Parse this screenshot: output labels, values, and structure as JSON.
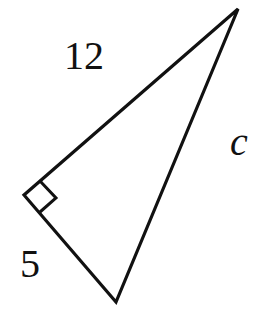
{
  "diagram": {
    "type": "right-triangle",
    "labels": {
      "leg_long": "12",
      "leg_short": "5",
      "hypotenuse": "c"
    },
    "vertices": {
      "top": [
        238,
        9
      ],
      "right_angle": [
        24,
        195
      ],
      "bottom": [
        116,
        302
      ]
    },
    "right_angle_marker": true,
    "stroke_color": "#111111"
  }
}
